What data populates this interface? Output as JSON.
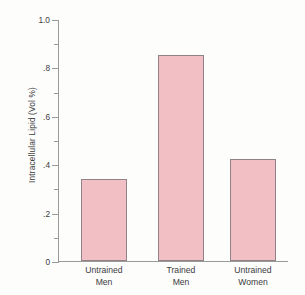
{
  "chart_data": {
    "type": "bar",
    "title": "",
    "xlabel": "",
    "ylabel": "Intracellular Lipid (Vol %)",
    "categories": [
      "Untrained Men",
      "Trained Men",
      "Untrained Women"
    ],
    "category_lines": [
      [
        "Untrained",
        "Men"
      ],
      [
        "Trained",
        "Men"
      ],
      [
        "Untrained",
        "Women"
      ]
    ],
    "values": [
      0.34,
      0.85,
      0.42
    ],
    "ylim": [
      0,
      1.0
    ],
    "y_major_ticks": [
      0,
      0.2,
      0.4,
      0.6,
      0.8,
      1.0
    ],
    "y_major_tick_labels": [
      "0",
      ".2",
      ".4",
      ".6",
      ".8",
      "1.0"
    ],
    "y_minor_ticks": [
      0.1,
      0.3,
      0.5,
      0.7,
      0.9
    ],
    "grid": false,
    "legend": "none",
    "bar_fill_color": "#f2bfc4",
    "bar_border_color": "#8f8289",
    "axis_color": "#9a9a9a",
    "background_color": "#fdfdfc"
  }
}
